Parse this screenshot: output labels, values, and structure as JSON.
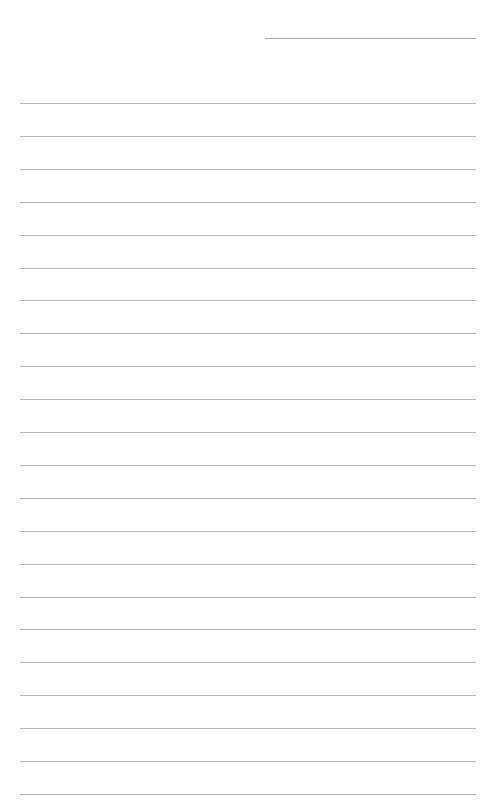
{
  "page": {
    "type": "lined-paper",
    "background_color": "#ffffff",
    "line_color": "#b2b2b2",
    "header_line": {
      "present": true
    },
    "ruled_lines": {
      "count": 22,
      "first_top": 103,
      "spacing": 32.9
    }
  }
}
